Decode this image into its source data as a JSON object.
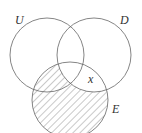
{
  "diagram": {
    "type": "venn",
    "sets": [
      {
        "name": "U",
        "label": "U"
      },
      {
        "name": "D",
        "label": "D"
      },
      {
        "name": "E",
        "label": "E"
      }
    ],
    "region_label": "x",
    "shaded_region": "E minus D",
    "stroke_color": "#555555"
  }
}
